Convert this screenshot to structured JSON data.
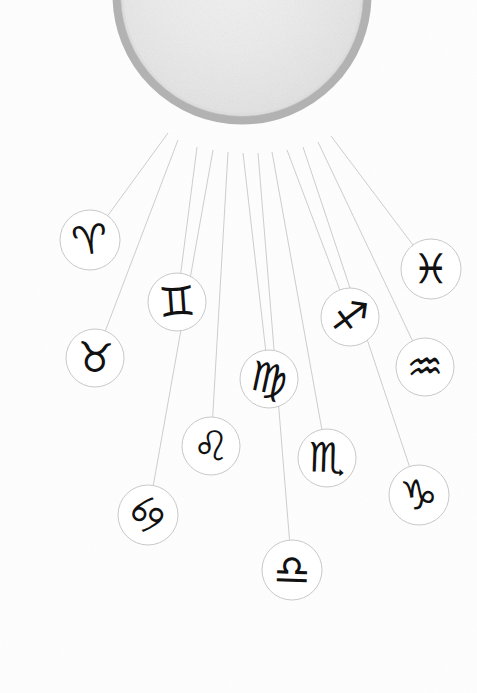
{
  "canvas": {
    "width": 477,
    "height": 693,
    "background": "#fdfdfd"
  },
  "poster": {
    "title": "Zodiac Mobile Illustration",
    "palette": {
      "paper": "#fdfdfd",
      "sun_fill": "#eeeeee",
      "sun_fill_2": "#e3e3e3",
      "sun_ring": "#b4b4b4",
      "thread": "#c9c9c9",
      "circle_outline": "#c2c2c2",
      "glyph_ink": "#111111",
      "flag_dark": "#3a3a3a",
      "flag_mid_dark": "#6e6e6e",
      "flag_mid": "#8e8e8e",
      "flag_light": "#b9b9b9",
      "flag_pale": "#d2d2d2"
    }
  },
  "sun": {
    "name": "textured-sun-disc",
    "cx": 242,
    "cy": -5,
    "r": 125,
    "ring_width": 9,
    "fill": "#ebebeb",
    "ring": "#b2b2b2"
  },
  "bunting": {
    "name": "pennant-garland",
    "count": 18,
    "radius": 176,
    "flags": [
      {
        "index": 0,
        "angle_deg": 222,
        "size": 37,
        "color": "#7d7d7d",
        "rotation": -48
      },
      {
        "index": 1,
        "angle_deg": 232,
        "size": 33,
        "color": "#777777",
        "rotation": -40
      },
      {
        "index": 2,
        "angle_deg": 243,
        "size": 38,
        "color": "#c0c0c0",
        "rotation": -30
      },
      {
        "index": 3,
        "angle_deg": 254,
        "size": 31,
        "color": "#cccccc",
        "rotation": -22
      },
      {
        "index": 4,
        "angle_deg": 263,
        "size": 35,
        "color": "#6f6f6f",
        "rotation": -14
      },
      {
        "index": 5,
        "angle_deg": 272,
        "size": 33,
        "color": "#3a3a3a",
        "rotation": -7
      },
      {
        "index": 6,
        "angle_deg": 281,
        "size": 35,
        "color": "#a8a8a8",
        "rotation": 0
      },
      {
        "index": 7,
        "angle_deg": 290,
        "size": 30,
        "color": "#9c9c9c",
        "rotation": 6
      },
      {
        "index": 8,
        "angle_deg": 299,
        "size": 36,
        "color": "#8d8d8d",
        "rotation": 13
      },
      {
        "index": 9,
        "angle_deg": 309,
        "size": 38,
        "color": "#7f7f7f",
        "rotation": 22
      },
      {
        "index": 10,
        "angle_deg": 319,
        "size": 35,
        "color": "#8a8a8a",
        "rotation": 32
      },
      {
        "index": 11,
        "angle_deg": 329,
        "size": 38,
        "color": "#c6c6c6",
        "rotation": 42
      },
      {
        "index": 12,
        "angle_deg": 339,
        "size": 34,
        "color": "#cfcfcf",
        "rotation": 52
      },
      {
        "index": 13,
        "angle_deg": 348,
        "size": 36,
        "color": "#6c6c6c",
        "rotation": 62
      }
    ]
  },
  "signs": [
    {
      "id": "aries",
      "name": "Aries",
      "glyph": "♈",
      "cx": 90,
      "cy": 240,
      "r": 30,
      "glyph_rot": -8,
      "font_size": 40,
      "thread_from": [
        168,
        133
      ]
    },
    {
      "id": "taurus",
      "name": "Taurus",
      "glyph": "♉",
      "cx": 95,
      "cy": 358,
      "r": 29,
      "glyph_rot": 4,
      "font_size": 41,
      "thread_from": [
        178,
        140
      ]
    },
    {
      "id": "gemini",
      "name": "Gemini",
      "glyph": "♊",
      "cx": 177,
      "cy": 302,
      "r": 29,
      "glyph_rot": -4,
      "font_size": 41,
      "thread_from": [
        197,
        147
      ]
    },
    {
      "id": "cancer",
      "name": "Cancer",
      "glyph": "♋",
      "cx": 148,
      "cy": 515,
      "r": 30,
      "glyph_rot": -35,
      "font_size": 41,
      "thread_from": [
        213,
        150
      ]
    },
    {
      "id": "leo",
      "name": "Leo",
      "glyph": "♌",
      "cx": 211,
      "cy": 446,
      "r": 29,
      "glyph_rot": 3,
      "font_size": 41,
      "thread_from": [
        228,
        152
      ]
    },
    {
      "id": "virgo",
      "name": "Virgo",
      "glyph": "♍",
      "cx": 269,
      "cy": 379,
      "r": 29,
      "glyph_rot": 12,
      "font_size": 41,
      "thread_from": [
        243,
        153
      ]
    },
    {
      "id": "libra",
      "name": "Libra",
      "glyph": "♎",
      "cx": 292,
      "cy": 570,
      "r": 30,
      "glyph_rot": 2,
      "font_size": 41,
      "thread_from": [
        258,
        153
      ]
    },
    {
      "id": "scorpio",
      "name": "Scorpio",
      "glyph": "♏",
      "cx": 327,
      "cy": 458,
      "r": 29,
      "glyph_rot": 2,
      "font_size": 41,
      "thread_from": [
        272,
        152
      ]
    },
    {
      "id": "sagittarius",
      "name": "Sagittarius",
      "glyph": "♐",
      "cx": 350,
      "cy": 317,
      "r": 29,
      "glyph_rot": 8,
      "font_size": 41,
      "thread_from": [
        287,
        150
      ]
    },
    {
      "id": "capricorn",
      "name": "Capricorn",
      "glyph": "♑",
      "cx": 419,
      "cy": 495,
      "r": 30,
      "glyph_rot": -6,
      "font_size": 41,
      "thread_from": [
        303,
        147
      ]
    },
    {
      "id": "aquarius",
      "name": "Aquarius",
      "glyph": "♒",
      "cx": 425,
      "cy": 367,
      "r": 29,
      "glyph_rot": -3,
      "font_size": 41,
      "thread_from": [
        318,
        142
      ]
    },
    {
      "id": "pisces",
      "name": "Pisces",
      "glyph": "♓",
      "cx": 431,
      "cy": 269,
      "r": 30,
      "glyph_rot": 0,
      "font_size": 41,
      "thread_from": [
        331,
        136
      ]
    }
  ]
}
